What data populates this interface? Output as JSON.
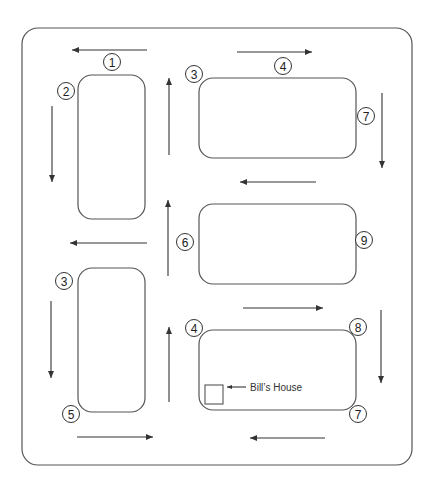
{
  "diagram": {
    "colors": {
      "stroke": "#555555",
      "arrow": "#333333",
      "background": "#ffffff"
    },
    "frame": {
      "x": 22,
      "y": 28,
      "w": 390,
      "h": 437,
      "r": 16
    },
    "blocks": [
      {
        "id": "block-top-left",
        "x": 78,
        "y": 75,
        "w": 67,
        "h": 144,
        "r": 14
      },
      {
        "id": "block-top-right",
        "x": 199,
        "y": 78,
        "w": 157,
        "h": 80,
        "r": 14
      },
      {
        "id": "block-middle-right",
        "x": 199,
        "y": 204,
        "w": 157,
        "h": 80,
        "r": 14
      },
      {
        "id": "block-bottom-left",
        "x": 78,
        "y": 268,
        "w": 67,
        "h": 144,
        "r": 14
      },
      {
        "id": "block-bottom-right",
        "x": 199,
        "y": 330,
        "w": 157,
        "h": 80,
        "r": 14
      }
    ],
    "markers": [
      {
        "label": "1",
        "cx": 112,
        "cy": 62
      },
      {
        "label": "2",
        "cx": 66,
        "cy": 91
      },
      {
        "label": "3",
        "cx": 194,
        "cy": 74
      },
      {
        "label": "4",
        "cx": 283,
        "cy": 66
      },
      {
        "label": "7",
        "cx": 366,
        "cy": 116
      },
      {
        "label": "6",
        "cx": 185,
        "cy": 242
      },
      {
        "label": "9",
        "cx": 364,
        "cy": 240
      },
      {
        "label": "3",
        "cx": 64,
        "cy": 281
      },
      {
        "label": "5",
        "cx": 71,
        "cy": 414
      },
      {
        "label": "4",
        "cx": 194,
        "cy": 328
      },
      {
        "label": "8",
        "cx": 358,
        "cy": 327
      },
      {
        "label": "7",
        "cx": 358,
        "cy": 414
      }
    ],
    "arrows": [
      {
        "direction": "left",
        "x1": 147,
        "y1": 50,
        "x2": 72,
        "y2": 50
      },
      {
        "direction": "right",
        "x1": 237,
        "y1": 52,
        "x2": 312,
        "y2": 52
      },
      {
        "direction": "down",
        "x1": 52,
        "y1": 106,
        "x2": 52,
        "y2": 182
      },
      {
        "direction": "up",
        "x1": 169,
        "y1": 155,
        "x2": 169,
        "y2": 78
      },
      {
        "direction": "down",
        "x1": 382,
        "y1": 93,
        "x2": 382,
        "y2": 168
      },
      {
        "direction": "left",
        "x1": 316,
        "y1": 182,
        "x2": 240,
        "y2": 182
      },
      {
        "direction": "up",
        "x1": 168,
        "y1": 276,
        "x2": 168,
        "y2": 200
      },
      {
        "direction": "left",
        "x1": 147,
        "y1": 243,
        "x2": 70,
        "y2": 243
      },
      {
        "direction": "right",
        "x1": 243,
        "y1": 308,
        "x2": 323,
        "y2": 308
      },
      {
        "direction": "down",
        "x1": 381,
        "y1": 310,
        "x2": 381,
        "y2": 383
      },
      {
        "direction": "down",
        "x1": 51,
        "y1": 301,
        "x2": 51,
        "y2": 378
      },
      {
        "direction": "up",
        "x1": 169,
        "y1": 402,
        "x2": 169,
        "y2": 327
      },
      {
        "direction": "right",
        "x1": 77,
        "y1": 437,
        "x2": 153,
        "y2": 437
      },
      {
        "direction": "left",
        "x1": 325,
        "y1": 438,
        "x2": 250,
        "y2": 438
      }
    ],
    "house": {
      "label": "Bill’s House",
      "x": 205,
      "y": 385,
      "w": 18,
      "h": 19,
      "pointer": {
        "x1": 246,
        "y1": 387,
        "x2": 227,
        "y2": 387
      },
      "label_x": 250,
      "label_y": 391
    }
  }
}
